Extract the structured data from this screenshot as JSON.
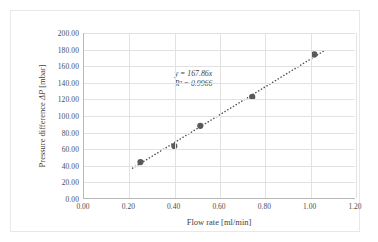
{
  "chart_data": {
    "type": "scatter",
    "title": "",
    "xlabel": "Flow rate [ml/min]",
    "ylabel": "Pressure difference ΔP [mbar]",
    "xlim": [
      0.0,
      1.2
    ],
    "ylim": [
      0.0,
      200.0
    ],
    "xticks": [
      "0.00",
      "0.20",
      "0.40",
      "0.60",
      "0.80",
      "1.00",
      "1.20"
    ],
    "xtick_values": [
      0.0,
      0.2,
      0.4,
      0.6,
      0.8,
      1.0,
      1.2
    ],
    "yticks": [
      "0.00",
      "20.00",
      "40.00",
      "60.00",
      "80.00",
      "100.00",
      "120.00",
      "140.00",
      "160.00",
      "180.00",
      "200.00"
    ],
    "ytick_values": [
      0,
      20,
      40,
      60,
      80,
      100,
      120,
      140,
      160,
      180,
      200
    ],
    "grid": true,
    "grid_axes": "both",
    "legend": false,
    "legend_position": "none",
    "series": [
      {
        "name": "Pressure difference",
        "marker": "circle",
        "marker_color": "#595959",
        "x": [
          0.25,
          0.4,
          0.515,
          0.745,
          1.02
        ],
        "values": [
          43.5,
          63.0,
          87.5,
          122.5,
          174.0
        ]
      }
    ],
    "trendline": {
      "type": "linear",
      "style": "dotted",
      "color": "#4d4d4d",
      "through_origin": true,
      "slope": 167.86,
      "intercept": 0,
      "x_start": 0.215,
      "x_end": 1.06,
      "equation_label": "y = 167.86x",
      "r2_label": "R² = 0.9966",
      "r2_value": 0.9966
    },
    "annotations": [
      {
        "text": "y = 167.86x",
        "x": 0.4,
        "y": 150
      },
      {
        "text": "R² = 0.9966",
        "x": 0.4,
        "y": 138
      }
    ]
  },
  "axis_titles": {
    "x": "Flow rate [ml/min]",
    "y_prefix": "Pressure difference ",
    "y_symbol": "ΔP",
    "y_suffix": " [mbar]"
  },
  "annotation": {
    "equation": "y = 167.86x",
    "r_squared": "R² = 0.9966"
  },
  "colors": {
    "marker": "#595959",
    "trendline": "#4d4d4d",
    "gridline": "#e2e2e2",
    "axis": "#b8b8b8",
    "frame": "#e8e8e8",
    "text": "#3f3f3f"
  }
}
